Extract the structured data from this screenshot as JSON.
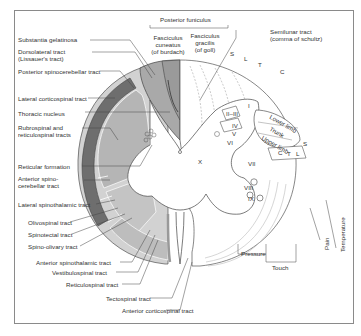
{
  "diagram": {
    "left_labels": [
      {
        "id": "substantia-gelatinosa",
        "text": "Substantia gelatinosa"
      },
      {
        "id": "dorsolateral-tract",
        "line1": "Dorsolateral tract",
        "line2": "(Lissauer's tract)"
      },
      {
        "id": "posterior-spinocerebellar",
        "text": "Posterior spinocerebellar tract"
      },
      {
        "id": "lateral-corticospinal",
        "text": "Lateral corticospinal tract"
      },
      {
        "id": "thoracic-nucleus",
        "text": "Thoracic nucleus"
      },
      {
        "id": "rubrospinal",
        "line1": "Rubrospinal and",
        "line2": "reticulospinal tracts"
      },
      {
        "id": "reticular-formation",
        "text": "Reticular formation"
      },
      {
        "id": "anterior-spinocerebellar",
        "line1": "Anterior spino-",
        "line2": "cerebellar tract"
      },
      {
        "id": "lateral-spinothalamic",
        "text": "Lateral spinothalamic tract"
      },
      {
        "id": "olivospinal",
        "text": "Olivospinal tract"
      },
      {
        "id": "spinotectal",
        "text": "Spinotectal tract"
      },
      {
        "id": "spino-olivary",
        "text": "Spino-olivary tract"
      },
      {
        "id": "anterior-spinothalamic",
        "text": "Anterior spinothalamic tract"
      },
      {
        "id": "vestibulospinal",
        "text": "Vestibulospinal tract"
      },
      {
        "id": "reticulospinal",
        "text": "Reticulospinal tract"
      },
      {
        "id": "tectospinal",
        "text": "Tectospinal tract"
      },
      {
        "id": "anterior-corticospinal",
        "text": "Anterior corticospinal tract"
      }
    ],
    "top_labels": {
      "posterior_funiculus": "Posterior funiculus",
      "fasciculus_cuneatus": {
        "line1": "Fasciculus",
        "line2": "cuneatus",
        "line3": "(of burdach)"
      },
      "fasciculus_gracilis": {
        "line1": "Fasciculus",
        "line2": "gracilis",
        "line3": "(of goll)"
      },
      "semilunar": {
        "line1": "Semilunar tract",
        "line2": "(comma of schultz)"
      }
    },
    "segment_letters_top": [
      "S",
      "L",
      "T",
      "C"
    ],
    "segment_letters_bottom": [
      "C",
      "T",
      "L"
    ],
    "segment_letter_side": "S",
    "body_regions": [
      "Lower limb",
      "Trunk",
      "Upper limb"
    ],
    "laminae": [
      "I",
      "II",
      "III",
      "IV",
      "V",
      "VI",
      "VII",
      "VIII",
      "IX",
      "X"
    ],
    "lamina_labels_visible": {
      "i": "I",
      "ii_iii": "II–III",
      "iv": "IV",
      "v": "V",
      "vi": "VI",
      "vii": "VII",
      "viii": "VIII",
      "ix": "IX",
      "x": "X"
    },
    "bottom_labels": {
      "pressure": "Pressure",
      "touch": "Touch"
    },
    "right_labels": {
      "pain": "Pain",
      "temperature": "Temperature"
    },
    "colors": {
      "dark_tract": "#6e6e6e",
      "mid_tract": "#a9a9a9",
      "light_tract": "#cdcdcd",
      "pale_fill": "#e4e4e4",
      "outline": "#444444",
      "frame": "#8a8a8a"
    }
  }
}
